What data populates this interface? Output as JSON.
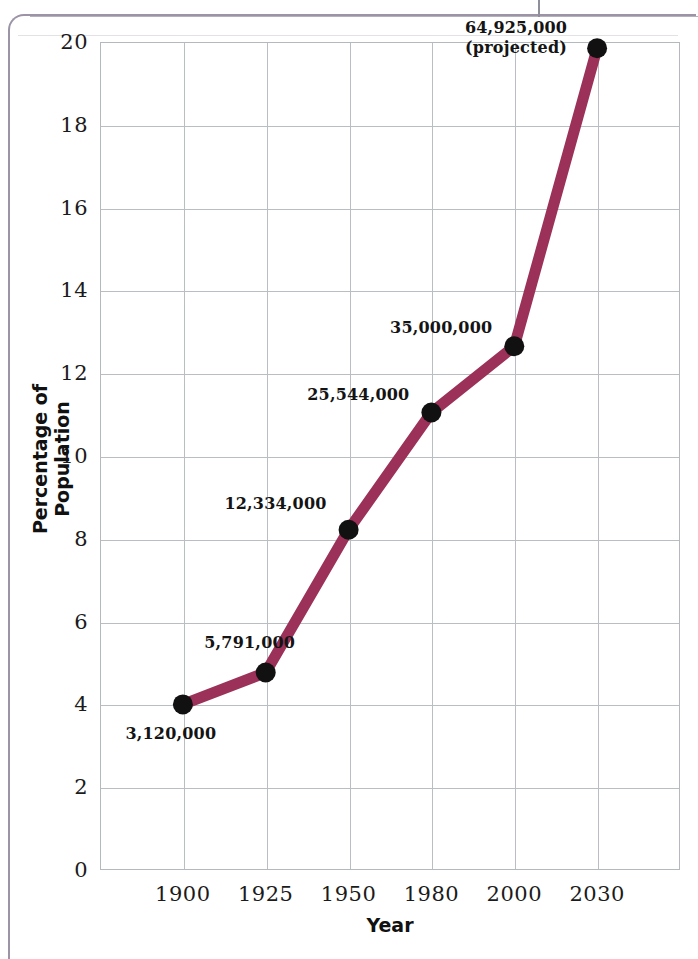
{
  "chart_data": {
    "type": "line",
    "title": "",
    "xlabel": "Year",
    "ylabel": "Percentage of Population",
    "x": [
      1900,
      1925,
      1950,
      1980,
      2000,
      2030
    ],
    "xtick_labels": [
      "1900",
      "1925",
      "1950",
      "1980",
      "2000",
      "2030"
    ],
    "values": [
      4.0,
      4.77,
      8.22,
      11.05,
      12.65,
      19.85
    ],
    "point_labels": [
      "3,120,000",
      "5,791,000",
      "12,334,000",
      "25,544,000",
      "35,000,000",
      "64,925,000\n(projected)"
    ],
    "ylim": [
      0,
      20
    ],
    "ytick_values": [
      0,
      2,
      4,
      6,
      8,
      10,
      12,
      14,
      16,
      18,
      20
    ],
    "ytick_labels": [
      "0",
      "2",
      "4",
      "6",
      "8",
      "10",
      "12",
      "14",
      "16",
      "18",
      "20"
    ],
    "grid": true,
    "legend": "none",
    "series_color": "#9b3158",
    "marker_color": "#111111",
    "gridline_color": "#b9bec2"
  },
  "frame": {
    "border_color": "#9c93a6"
  }
}
